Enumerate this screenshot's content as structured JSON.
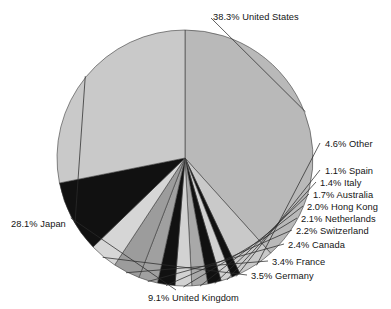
{
  "chart_data": {
    "type": "pie",
    "title": "Year End 1997",
    "subtitle": "",
    "xlabel": "",
    "ylabel": "",
    "grid": false,
    "legend_position": "none",
    "label_format": "{percent}% {category}",
    "start_angle_deg": 0,
    "direction": "clockwise",
    "units": "percent",
    "categories": [
      "United States",
      "Other",
      "Spain",
      "Italy",
      "Australia",
      "Hong Kong",
      "Netherlands",
      "Switzerland",
      "Canada",
      "France",
      "Germany",
      "United Kingdom",
      "Japan"
    ],
    "values": [
      38.3,
      4.6,
      1.1,
      1.4,
      1.7,
      2.0,
      2.1,
      2.2,
      2.4,
      3.4,
      3.5,
      9.1,
      28.1
    ],
    "colors": [
      "#b9b9b9",
      "#c9c9c9",
      "#111111",
      "#d2d2d2",
      "#111111",
      "#a9a9a9",
      "#d2d2d2",
      "#111111",
      "#a0a0a0",
      "#9c9c9c",
      "#d6d6d6",
      "#111111",
      "#c9c9c9"
    ],
    "slices": [
      {
        "label": "38.3% United States",
        "category": "United States",
        "percent": 38.3,
        "color": "#b9b9b9"
      },
      {
        "label": "4.6% Other",
        "category": "Other",
        "percent": 4.6,
        "color": "#c9c9c9"
      },
      {
        "label": "1.1% Spain",
        "category": "Spain",
        "percent": 1.1,
        "color": "#111111"
      },
      {
        "label": "1.4% Italy",
        "category": "Italy",
        "percent": 1.4,
        "color": "#d2d2d2"
      },
      {
        "label": "1.7% Australia",
        "category": "Australia",
        "percent": 1.7,
        "color": "#111111"
      },
      {
        "label": "2.0% Hong Kong",
        "category": "Hong Kong",
        "percent": 2.0,
        "color": "#a9a9a9"
      },
      {
        "label": "2.1% Netherlands",
        "category": "Netherlands",
        "percent": 2.1,
        "color": "#d2d2d2"
      },
      {
        "label": "2.2% Switzerland",
        "category": "Switzerland",
        "percent": 2.2,
        "color": "#111111"
      },
      {
        "label": "2.4% Canada",
        "category": "Canada",
        "percent": 2.4,
        "color": "#a0a0a0"
      },
      {
        "label": "3.4% France",
        "category": "France",
        "percent": 3.4,
        "color": "#9c9c9c"
      },
      {
        "label": "3.5% Germany",
        "category": "Germany",
        "percent": 3.5,
        "color": "#d6d6d6"
      },
      {
        "label": "9.1% United Kingdom",
        "category": "United Kingdom",
        "percent": 9.1,
        "color": "#111111"
      },
      {
        "label": "28.1% Japan",
        "category": "Japan",
        "percent": 28.1,
        "color": "#c9c9c9"
      }
    ]
  },
  "geometry": {
    "center_x": 185,
    "center_y": 158,
    "radius": 128
  },
  "labels": {
    "united_states": {
      "text": "38.3% United States",
      "x": 213,
      "y": 12,
      "align": "left"
    },
    "other": {
      "text": "4.6% Other",
      "x": 325,
      "y": 139,
      "align": "left"
    },
    "spain": {
      "text": "1.1% Spain",
      "x": 325,
      "y": 166,
      "align": "left"
    },
    "italy": {
      "text": "1.4% Italy",
      "x": 320,
      "y": 178,
      "align": "left"
    },
    "australia": {
      "text": "1.7% Australia",
      "x": 313,
      "y": 190,
      "align": "left"
    },
    "hong_kong": {
      "text": "2.0% Hong Kong",
      "x": 307,
      "y": 202,
      "align": "left"
    },
    "netherlands": {
      "text": "2.1% Netherlands",
      "x": 301,
      "y": 214,
      "align": "left"
    },
    "switzerland": {
      "text": "2.2% Switzerland",
      "x": 296,
      "y": 226,
      "align": "left"
    },
    "canada": {
      "text": "2.4% Canada",
      "x": 288,
      "y": 240,
      "align": "left"
    },
    "france": {
      "text": "3.4% France",
      "x": 272,
      "y": 257,
      "align": "left"
    },
    "germany": {
      "text": "3.5% Germany",
      "x": 251,
      "y": 271,
      "align": "left"
    },
    "united_kingdom": {
      "text": "9.1% United Kingdom",
      "x": 148,
      "y": 293,
      "align": "left"
    },
    "japan": {
      "text": "28.1% Japan",
      "x": 11,
      "y": 219,
      "align": "left"
    }
  }
}
